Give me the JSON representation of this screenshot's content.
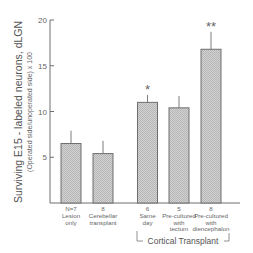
{
  "chart_data": {
    "type": "bar",
    "title": "",
    "ylabel": "Surviving E15 - labeled neurons, dLGN",
    "ylabel_sub": "(Operated side/unoperated side) x 100",
    "xlabel": "",
    "ylim": [
      0,
      20
    ],
    "yticks": [
      5,
      10,
      15,
      20
    ],
    "grid": false,
    "legend": null,
    "categories": [
      "Lesion only",
      "Cerebellar transplant",
      "Same day",
      "Pre-cultured with tectum",
      "Pre-cultured with diencephalon"
    ],
    "category_lines": [
      [
        "Lesion",
        "only"
      ],
      [
        "Cerebellar",
        "transplant"
      ],
      [
        "Same",
        "day"
      ],
      [
        "Pre-cultured",
        "with",
        "tectum"
      ],
      [
        "Pre-cultured",
        "with",
        "diencephalon"
      ]
    ],
    "n_labels": [
      "N=7",
      "8",
      "6",
      "5",
      "8"
    ],
    "values": [
      6.5,
      5.4,
      11.0,
      10.4,
      16.8
    ],
    "error_upper": [
      7.9,
      6.8,
      11.8,
      11.7,
      18.7
    ],
    "significance": [
      "",
      "",
      "*",
      "",
      "**"
    ],
    "group_annotation": {
      "label": "Cortical Transplant",
      "spans_categories": [
        2,
        3,
        4
      ]
    },
    "colors": {
      "bar_fill": "#c6c6c6",
      "bar_stroke": "#6e6e6e",
      "axis": "#6e6e6e",
      "text": "#555555"
    }
  }
}
